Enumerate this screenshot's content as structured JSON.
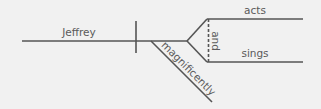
{
  "diagram": {
    "type": "sentence-diagram",
    "subject": "Jeffrey",
    "verbs": [
      "acts",
      "sings"
    ],
    "conjunction": "and",
    "modifier": "magnificently"
  },
  "colors": {
    "background": "#f1f1f1",
    "line": "#555555",
    "text": "#5a5a5a"
  }
}
